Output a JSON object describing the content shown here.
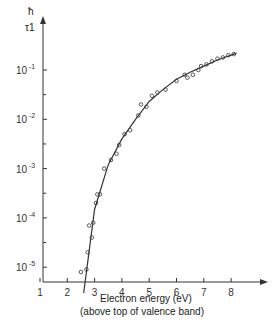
{
  "chart_data": {
    "type": "scatter",
    "title": "",
    "ylabel_num": "ħ",
    "ylabel_den": "τ1",
    "xlabel": "Electron energy (eV)",
    "xlabel2": "(above top of valence band)",
    "x_ticks": [
      1,
      2,
      3,
      4,
      5,
      6,
      7,
      8
    ],
    "y_ticks": [
      "10 -1",
      "10 -2",
      "10 -3",
      "10 -4",
      "10 -5"
    ],
    "yscale": "log",
    "xlim": [
      1,
      9
    ],
    "ylim": [
      3e-06,
      1
    ],
    "points": [
      [
        2.5,
        8e-06
      ],
      [
        2.7,
        9e-06
      ],
      [
        2.75,
        2e-05
      ],
      [
        2.8,
        7e-05
      ],
      [
        2.9,
        4e-05
      ],
      [
        2.95,
        8e-05
      ],
      [
        3.05,
        0.0002
      ],
      [
        3.1,
        0.0003
      ],
      [
        3.2,
        0.0003
      ],
      [
        3.35,
        0.001
      ],
      [
        3.6,
        0.0015
      ],
      [
        3.8,
        0.002
      ],
      [
        3.9,
        0.003
      ],
      [
        4.1,
        0.005
      ],
      [
        4.3,
        0.006
      ],
      [
        4.6,
        0.012
      ],
      [
        4.7,
        0.02
      ],
      [
        4.9,
        0.018
      ],
      [
        5.1,
        0.03
      ],
      [
        5.3,
        0.035
      ],
      [
        5.6,
        0.04
      ],
      [
        6.0,
        0.06
      ],
      [
        6.3,
        0.08
      ],
      [
        6.4,
        0.07
      ],
      [
        6.6,
        0.08
      ],
      [
        6.8,
        0.1
      ],
      [
        6.9,
        0.12
      ],
      [
        7.1,
        0.13
      ],
      [
        7.3,
        0.15
      ],
      [
        7.5,
        0.17
      ],
      [
        7.7,
        0.18
      ],
      [
        7.9,
        0.2
      ],
      [
        8.1,
        0.21
      ]
    ],
    "curve": [
      [
        2.6,
        3e-06
      ],
      [
        3,
        0.00015
      ],
      [
        3.5,
        0.0012
      ],
      [
        4,
        0.004
      ],
      [
        4.5,
        0.01
      ],
      [
        5,
        0.023
      ],
      [
        5.5,
        0.04
      ],
      [
        6,
        0.065
      ],
      [
        6.5,
        0.09
      ],
      [
        7,
        0.12
      ],
      [
        7.5,
        0.16
      ],
      [
        8,
        0.2
      ],
      [
        8.2,
        0.22
      ]
    ]
  }
}
